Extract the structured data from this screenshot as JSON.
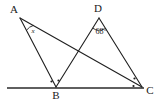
{
  "figure": {
    "stroke_color": "#1f1f1f",
    "background_color": "#ffffff",
    "labels": {
      "A": "A",
      "B": "B",
      "C": "C",
      "D": "D"
    },
    "angles": {
      "at_A": "x",
      "at_D": "68°"
    },
    "vertices": [
      {
        "name": "A",
        "label": "A",
        "x": 20,
        "y": 18,
        "label_x": 14,
        "label_y": 10
      },
      {
        "name": "D",
        "label": "D",
        "x": 99,
        "y": 18,
        "label_x": 98,
        "label_y": 9
      },
      {
        "name": "B",
        "label": "B",
        "x": 56,
        "y": 87,
        "label_x": 56,
        "label_y": 96
      },
      {
        "name": "C",
        "label": "C",
        "x": 142,
        "y": 87,
        "label_x": 150,
        "label_y": 91
      }
    ],
    "segments": [
      {
        "name": "segment-AB",
        "from": "A",
        "to": "B"
      },
      {
        "name": "segment-AC",
        "from": "A",
        "to": "C"
      },
      {
        "name": "segment-DB",
        "from": "D",
        "to": "B"
      },
      {
        "name": "segment-DC",
        "from": "D",
        "to": "C"
      }
    ],
    "baseline": {
      "name": "baseline",
      "x1": 7,
      "y1": 88,
      "x2": 144,
      "y2": 88
    },
    "tick_marks": {
      "at_B_count": 2,
      "at_C_count": 2
    }
  }
}
